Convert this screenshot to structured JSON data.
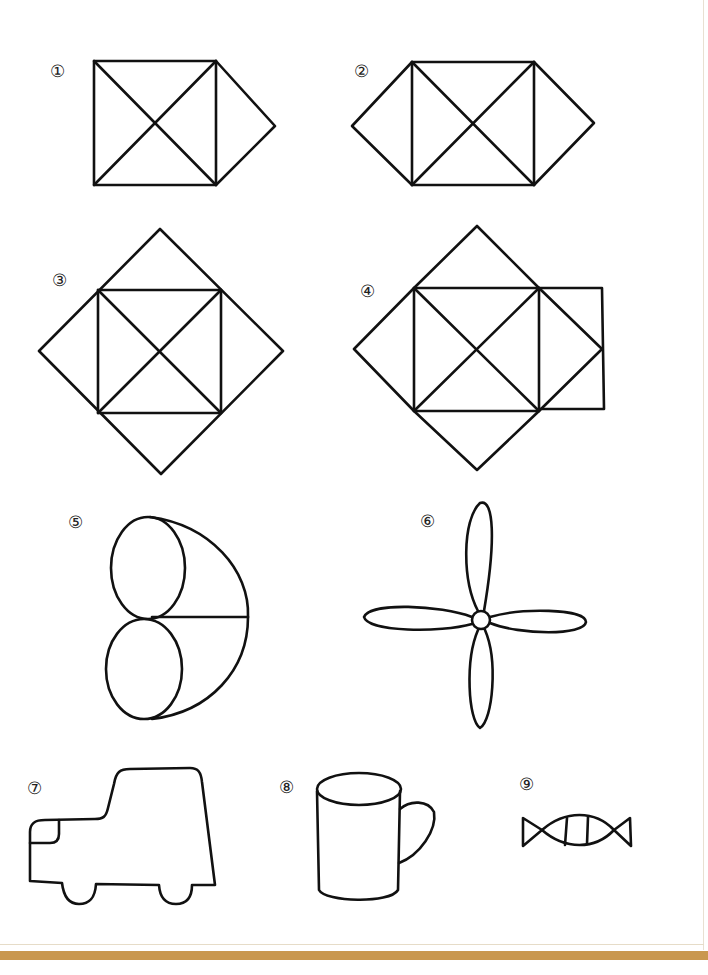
{
  "figures": [
    {
      "id": 1,
      "label": "①",
      "description": "square with diagonals and right triangle"
    },
    {
      "id": 2,
      "label": "②",
      "description": "square with diagonals and left and right triangles"
    },
    {
      "id": 3,
      "label": "③",
      "description": "square with diagonals inside rotated square"
    },
    {
      "id": 4,
      "label": "④",
      "description": "square with diagonals inside rotated square with extra square on right"
    },
    {
      "id": 5,
      "label": "⑤",
      "description": "two stacked ellipses with curved outline"
    },
    {
      "id": 6,
      "label": "⑥",
      "description": "four-blade propeller"
    },
    {
      "id": 7,
      "label": "⑦",
      "description": "car outline"
    },
    {
      "id": 8,
      "label": "⑧",
      "description": "mug"
    },
    {
      "id": 9,
      "label": "⑨",
      "description": "wrapped candy"
    }
  ],
  "colors": {
    "stroke": "#111111",
    "band": "#c9974e",
    "background": "#ffffff"
  }
}
